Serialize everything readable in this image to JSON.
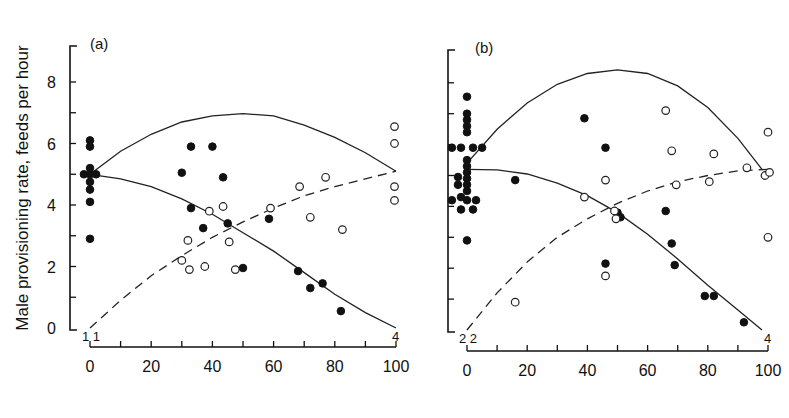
{
  "figure": {
    "ylabel": "Male provisioning rate, feeds per hour",
    "xlabel_partial": "Percent of nestlings fed by females (cut off)"
  },
  "chart_data": [
    {
      "type": "scatter",
      "panel_label": "(a)",
      "ylabel": "Male provisioning rate, feeds per hour",
      "xlabel": "",
      "xlim": [
        0,
        100
      ],
      "ylim": [
        0,
        9
      ],
      "x_ticks": [
        0,
        20,
        40,
        60,
        80,
        100
      ],
      "x_minor_step": 10,
      "y_ticks": [
        0,
        2,
        4,
        6,
        8
      ],
      "y_minor_step": 1,
      "grid": false,
      "count_annotations": [
        {
          "text": "1 1",
          "x": 2,
          "y": 0
        },
        {
          "text": "4",
          "x": 100,
          "y": 0
        }
      ],
      "series": [
        {
          "name": "filled",
          "marker": "filled-circle",
          "points": [
            [
              0,
              6.1
            ],
            [
              0,
              5.9
            ],
            [
              0,
              5.2
            ],
            [
              -2,
              5.0
            ],
            [
              0,
              5.0
            ],
            [
              2,
              5.0
            ],
            [
              0,
              4.75
            ],
            [
              0,
              4.5
            ],
            [
              0,
              4.1
            ],
            [
              0,
              2.9
            ],
            [
              30,
              5.05
            ],
            [
              33,
              5.9
            ],
            [
              40,
              5.9
            ],
            [
              43.5,
              4.9
            ],
            [
              33,
              3.9
            ],
            [
              37,
              3.25
            ],
            [
              45,
              3.4
            ],
            [
              50,
              1.95
            ],
            [
              58.5,
              3.55
            ],
            [
              68,
              1.85
            ],
            [
              72,
              1.3
            ],
            [
              76,
              1.45
            ],
            [
              82,
              0.55
            ]
          ]
        },
        {
          "name": "open",
          "marker": "open-circle",
          "points": [
            [
              39,
              3.8
            ],
            [
              43.5,
              3.95
            ],
            [
              32,
              2.85
            ],
            [
              45.5,
              2.8
            ],
            [
              30,
              2.2
            ],
            [
              32.5,
              1.9
            ],
            [
              37.5,
              2.0
            ],
            [
              47.5,
              1.9
            ],
            [
              59,
              3.9
            ],
            [
              68.5,
              4.6
            ],
            [
              77,
              4.9
            ],
            [
              72,
              3.6
            ],
            [
              82.5,
              3.2
            ],
            [
              99.5,
              6.55
            ],
            [
              99.5,
              6.0
            ],
            [
              99.5,
              4.6
            ],
            [
              99.5,
              4.15
            ]
          ]
        }
      ],
      "curves": [
        {
          "name": "upper-solid",
          "style": "solid",
          "points": [
            [
              0,
              5.0
            ],
            [
              10,
              5.75
            ],
            [
              20,
              6.3
            ],
            [
              30,
              6.7
            ],
            [
              40,
              6.9
            ],
            [
              50,
              6.97
            ],
            [
              60,
              6.9
            ],
            [
              70,
              6.6
            ],
            [
              80,
              6.2
            ],
            [
              90,
              5.7
            ],
            [
              100,
              5.1
            ]
          ]
        },
        {
          "name": "lower-solid",
          "style": "solid",
          "points": [
            [
              0,
              5.0
            ],
            [
              10,
              4.85
            ],
            [
              20,
              4.6
            ],
            [
              30,
              4.2
            ],
            [
              40,
              3.7
            ],
            [
              50,
              3.1
            ],
            [
              60,
              2.5
            ],
            [
              70,
              1.8
            ],
            [
              80,
              1.1
            ],
            [
              90,
              0.5
            ],
            [
              100,
              0.0
            ]
          ]
        },
        {
          "name": "dashed",
          "style": "dashed",
          "points": [
            [
              0,
              0.0
            ],
            [
              10,
              0.9
            ],
            [
              20,
              1.7
            ],
            [
              30,
              2.35
            ],
            [
              40,
              2.95
            ],
            [
              50,
              3.45
            ],
            [
              60,
              3.9
            ],
            [
              70,
              4.3
            ],
            [
              80,
              4.6
            ],
            [
              90,
              4.85
            ],
            [
              100,
              5.1
            ]
          ]
        }
      ]
    },
    {
      "type": "scatter",
      "panel_label": "(b)",
      "ylabel": "",
      "xlabel": "",
      "xlim": [
        0,
        100
      ],
      "ylim": [
        0,
        9
      ],
      "x_ticks": [
        0,
        20,
        40,
        60,
        80,
        100
      ],
      "x_minor_step": 10,
      "y_ticks": [
        0,
        2,
        4,
        6,
        8
      ],
      "y_minor_step": 1,
      "grid": false,
      "count_annotations": [
        {
          "text": "2 2",
          "x": 2,
          "y": 0
        },
        {
          "text": "4",
          "x": 100,
          "y": 0
        }
      ],
      "series": [
        {
          "name": "filled",
          "marker": "filled-circle",
          "points": [
            [
              0,
              7.55
            ],
            [
              0,
              7.0
            ],
            [
              0,
              6.8
            ],
            [
              0,
              6.6
            ],
            [
              0,
              6.4
            ],
            [
              -5,
              5.9
            ],
            [
              -2,
              5.9
            ],
            [
              2,
              5.9
            ],
            [
              5,
              5.9
            ],
            [
              0,
              5.5
            ],
            [
              0,
              5.3
            ],
            [
              0,
              5.1
            ],
            [
              -3,
              4.95
            ],
            [
              0,
              4.9
            ],
            [
              -3,
              4.7
            ],
            [
              0,
              4.7
            ],
            [
              0,
              4.5
            ],
            [
              -5,
              4.2
            ],
            [
              -2,
              4.3
            ],
            [
              0,
              4.2
            ],
            [
              3,
              4.2
            ],
            [
              -2,
              3.9
            ],
            [
              2,
              3.9
            ],
            [
              0,
              2.9
            ],
            [
              16,
              4.85
            ],
            [
              39,
              6.85
            ],
            [
              46,
              5.9
            ],
            [
              50,
              3.8
            ],
            [
              51,
              3.65
            ],
            [
              46,
              2.15
            ],
            [
              66,
              3.85
            ],
            [
              68,
              2.8
            ],
            [
              69,
              2.1
            ],
            [
              79,
              1.1
            ],
            [
              82,
              1.1
            ],
            [
              92,
              0.25
            ]
          ]
        },
        {
          "name": "open",
          "marker": "open-circle",
          "points": [
            [
              16,
              0.9
            ],
            [
              39,
              4.3
            ],
            [
              46,
              4.85
            ],
            [
              46,
              1.75
            ],
            [
              49,
              3.85
            ],
            [
              49.5,
              3.6
            ],
            [
              66,
              7.1
            ],
            [
              68,
              5.8
            ],
            [
              69.5,
              4.7
            ],
            [
              80.5,
              4.8
            ],
            [
              82,
              5.7
            ],
            [
              93,
              5.25
            ],
            [
              99,
              5.0
            ],
            [
              100.5,
              5.1
            ],
            [
              100,
              6.4
            ],
            [
              100,
              3.0
            ]
          ]
        }
      ],
      "curves": [
        {
          "name": "upper-solid",
          "style": "solid",
          "points": [
            [
              0,
              5.4
            ],
            [
              10,
              6.5
            ],
            [
              20,
              7.35
            ],
            [
              30,
              7.95
            ],
            [
              40,
              8.3
            ],
            [
              50,
              8.42
            ],
            [
              60,
              8.3
            ],
            [
              70,
              7.9
            ],
            [
              80,
              7.2
            ],
            [
              90,
              6.2
            ],
            [
              98,
              5.2
            ]
          ]
        },
        {
          "name": "lower-solid",
          "style": "solid",
          "points": [
            [
              0,
              5.2
            ],
            [
              10,
              5.18
            ],
            [
              20,
              5.05
            ],
            [
              30,
              4.75
            ],
            [
              40,
              4.35
            ],
            [
              50,
              3.8
            ],
            [
              60,
              3.1
            ],
            [
              70,
              2.3
            ],
            [
              80,
              1.45
            ],
            [
              90,
              0.65
            ],
            [
              98,
              0.0
            ]
          ]
        },
        {
          "name": "dashed",
          "style": "dashed",
          "points": [
            [
              0,
              0.0
            ],
            [
              10,
              1.2
            ],
            [
              20,
              2.2
            ],
            [
              30,
              3.0
            ],
            [
              40,
              3.6
            ],
            [
              50,
              4.1
            ],
            [
              60,
              4.5
            ],
            [
              70,
              4.8
            ],
            [
              80,
              5.0
            ],
            [
              90,
              5.15
            ],
            [
              100,
              5.2
            ]
          ]
        }
      ]
    }
  ]
}
